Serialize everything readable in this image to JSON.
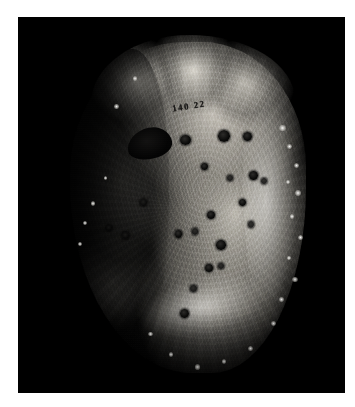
{
  "image": {
    "kind": "specimen-photograph",
    "caption": "",
    "background_color": "#000000",
    "mount_color": "#ffffff",
    "width": 355,
    "height": 407
  },
  "frame": {
    "left": 18,
    "top": 17,
    "width": 327,
    "height": 376
  },
  "subject": {
    "name": "specimen",
    "description": "Dried plant specimen with pitted surface",
    "highlight_color": "#e8e6e0",
    "midtone_color": "#8a8882",
    "shadow_color": "#0a0a09"
  },
  "annotations": {
    "catalog_mark": "140 22"
  },
  "pits": [
    {
      "left": 48.0,
      "top": 29.0,
      "w": 4.2,
      "h": 3.0,
      "soft": false
    },
    {
      "left": 62.5,
      "top": 27.5,
      "w": 4.6,
      "h": 3.4,
      "soft": false
    },
    {
      "left": 72.0,
      "top": 28.0,
      "w": 3.4,
      "h": 2.6,
      "soft": false
    },
    {
      "left": 56.0,
      "top": 37.0,
      "w": 2.8,
      "h": 2.2,
      "soft": false
    },
    {
      "left": 66.0,
      "top": 40.5,
      "w": 2.4,
      "h": 1.9,
      "soft": true
    },
    {
      "left": 74.5,
      "top": 39.5,
      "w": 3.2,
      "h": 2.4,
      "soft": false
    },
    {
      "left": 79.0,
      "top": 41.5,
      "w": 2.2,
      "h": 1.8,
      "soft": true
    },
    {
      "left": 70.5,
      "top": 47.5,
      "w": 2.6,
      "h": 2.0,
      "soft": false
    },
    {
      "left": 58.5,
      "top": 51.0,
      "w": 3.0,
      "h": 2.3,
      "soft": false
    },
    {
      "left": 74.0,
      "top": 54.0,
      "w": 2.4,
      "h": 1.9,
      "soft": true
    },
    {
      "left": 46.0,
      "top": 56.5,
      "w": 3.0,
      "h": 2.4,
      "soft": false
    },
    {
      "left": 52.5,
      "top": 56.0,
      "w": 2.6,
      "h": 2.0,
      "soft": true
    },
    {
      "left": 62.0,
      "top": 59.5,
      "w": 3.6,
      "h": 2.8,
      "soft": false
    },
    {
      "left": 57.5,
      "top": 66.5,
      "w": 3.0,
      "h": 2.3,
      "soft": false
    },
    {
      "left": 62.5,
      "top": 66.0,
      "w": 2.4,
      "h": 1.9,
      "soft": true
    },
    {
      "left": 52.0,
      "top": 72.5,
      "w": 2.6,
      "h": 2.1,
      "soft": true
    },
    {
      "left": 48.0,
      "top": 79.5,
      "w": 3.4,
      "h": 2.6,
      "soft": false
    },
    {
      "left": 33.0,
      "top": 47.5,
      "w": 2.4,
      "h": 2.0,
      "soft": true
    },
    {
      "left": 26.0,
      "top": 57.0,
      "w": 2.8,
      "h": 2.2,
      "soft": true
    },
    {
      "left": 20.0,
      "top": 55.0,
      "w": 2.2,
      "h": 1.8,
      "soft": true
    }
  ],
  "spines": [
    {
      "left": 86.0,
      "top": 26.0,
      "s": 2.4
    },
    {
      "left": 89.0,
      "top": 31.5,
      "s": 1.8
    },
    {
      "left": 91.5,
      "top": 37.0,
      "s": 2.0
    },
    {
      "left": 88.5,
      "top": 42.0,
      "s": 1.6
    },
    {
      "left": 92.0,
      "top": 45.0,
      "s": 2.2
    },
    {
      "left": 90.0,
      "top": 52.0,
      "s": 1.7
    },
    {
      "left": 93.0,
      "top": 58.0,
      "s": 1.9
    },
    {
      "left": 89.0,
      "top": 64.0,
      "s": 1.5
    },
    {
      "left": 91.0,
      "top": 70.0,
      "s": 2.1
    },
    {
      "left": 86.0,
      "top": 76.0,
      "s": 1.6
    },
    {
      "left": 83.0,
      "top": 83.0,
      "s": 1.8
    },
    {
      "left": 74.0,
      "top": 90.0,
      "s": 2.0
    },
    {
      "left": 64.0,
      "top": 94.0,
      "s": 1.7
    },
    {
      "left": 54.0,
      "top": 95.5,
      "s": 1.9
    },
    {
      "left": 44.0,
      "top": 92.0,
      "s": 1.5
    },
    {
      "left": 36.0,
      "top": 86.0,
      "s": 1.6
    },
    {
      "left": 14.0,
      "top": 48.0,
      "s": 1.8
    },
    {
      "left": 11.0,
      "top": 54.0,
      "s": 1.5
    },
    {
      "left": 9.0,
      "top": 60.0,
      "s": 1.6
    },
    {
      "left": 19.0,
      "top": 41.0,
      "s": 1.4
    },
    {
      "left": 23.0,
      "top": 20.0,
      "s": 1.7
    },
    {
      "left": 30.0,
      "top": 12.0,
      "s": 1.5
    }
  ]
}
